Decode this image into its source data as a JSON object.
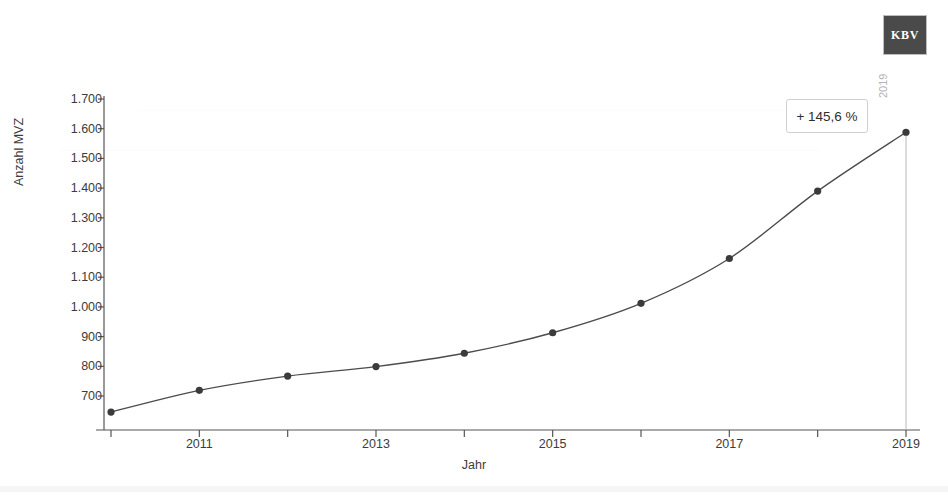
{
  "logo": {
    "text": "KBV",
    "color": "#4a4a4a"
  },
  "callout": {
    "label": "+ 145,6 %"
  },
  "end_marker": {
    "label": "2019"
  },
  "chart_data": {
    "type": "line",
    "title": "",
    "xlabel": "Jahr",
    "ylabel": "Anzahl MVZ",
    "x": [
      2010,
      2011,
      2012,
      2013,
      2014,
      2015,
      2016,
      2017,
      2018,
      2019
    ],
    "values": [
      646,
      719,
      767,
      799,
      844,
      913,
      1012,
      1163,
      1390,
      1588
    ],
    "series": [
      {
        "name": "Anzahl MVZ",
        "values": [
          646,
          719,
          767,
          799,
          844,
          913,
          1012,
          1163,
          1390,
          1588
        ]
      }
    ],
    "xtick_labels": [
      "2011",
      "2013",
      "2015",
      "2017",
      "2019"
    ],
    "xtick_values": [
      2011,
      2013,
      2015,
      2017,
      2019
    ],
    "xtick_minor_values": [
      2010,
      2012,
      2014,
      2016,
      2018
    ],
    "ytick_labels": [
      "1.700",
      "1.600",
      "1.500",
      "1.400",
      "1.300",
      "1.200",
      "1.100",
      "1.000",
      "900",
      "800",
      "700"
    ],
    "ytick_values": [
      1700,
      1600,
      1500,
      1400,
      1300,
      1200,
      1100,
      1000,
      900,
      800,
      700
    ],
    "xlim": [
      2009.6,
      2019.2
    ],
    "ylim": [
      600,
      1700
    ],
    "grid": false,
    "legend": false,
    "annotations": [
      {
        "text": "+ 145,6 %",
        "kind": "growth-box"
      },
      {
        "text": "2019",
        "kind": "endpoint-label"
      }
    ],
    "line_color": "#4c4c4c",
    "marker_color": "#3b3b3b",
    "axis_color": "#555555"
  }
}
